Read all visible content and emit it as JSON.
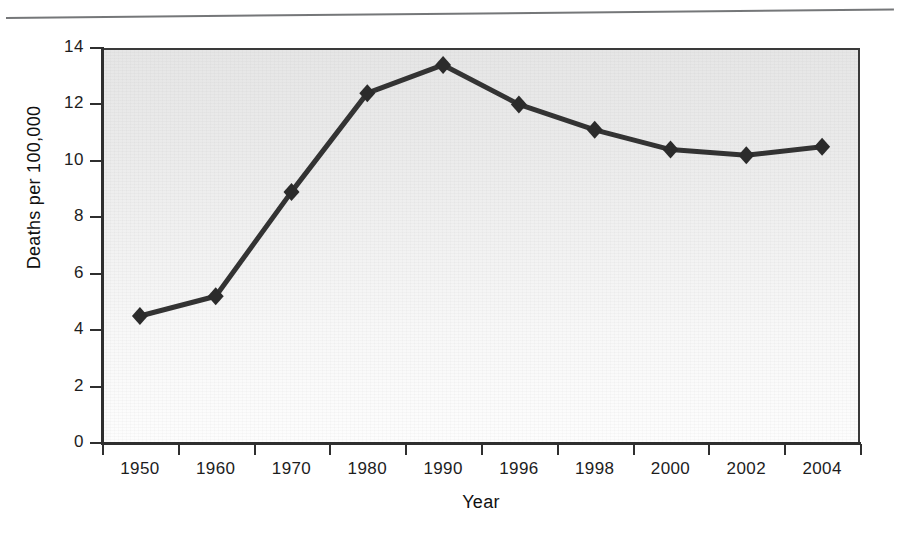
{
  "page": {
    "has_top_rule": true
  },
  "chart_data": {
    "type": "line",
    "title": "",
    "subtitle": "",
    "xlabel": "Year",
    "ylabel": "Deaths per 100,000",
    "categories": [
      "1950",
      "1960",
      "1970",
      "1980",
      "1990",
      "1996",
      "1998",
      "2000",
      "2002",
      "2004"
    ],
    "values": [
      4.5,
      5.2,
      8.9,
      12.4,
      13.4,
      12.0,
      11.1,
      10.4,
      10.2,
      10.5
    ],
    "series": [
      {
        "name": "Deaths per 100,000",
        "values": [
          4.5,
          5.2,
          8.9,
          12.4,
          13.4,
          12.0,
          11.1,
          10.4,
          10.2,
          10.5
        ]
      }
    ],
    "ylim": [
      0,
      14
    ],
    "yticks": [
      0,
      2,
      4,
      6,
      8,
      10,
      12,
      14
    ],
    "ytick_labels": [
      "0",
      "2",
      "4",
      "6",
      "8",
      "10",
      "12",
      "14"
    ],
    "grid": false,
    "legend": "none",
    "marker": "diamond",
    "line_color": "#333333",
    "marker_color": "#2b2b2b",
    "plot_background": "#eaeaea",
    "axis_color": "#2f2f2f"
  }
}
